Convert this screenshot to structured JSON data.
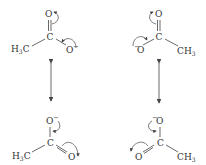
{
  "diagram": {
    "structures": [
      {
        "id": "top-left",
        "atoms": {
          "o_top": "O",
          "c_center": "C",
          "methyl": "H3C",
          "o_side": "O",
          "o_side_charge": "−"
        }
      },
      {
        "id": "top-right",
        "atoms": {
          "o_top": "O",
          "c_center": "C",
          "methyl": "CH3",
          "o_side": "O",
          "o_side_charge": "−"
        }
      },
      {
        "id": "bottom-left",
        "atoms": {
          "o_top": "O",
          "o_top_charge": "−",
          "c_center": "C",
          "methyl": "H3C",
          "o_side": "O"
        }
      },
      {
        "id": "bottom-right",
        "atoms": {
          "o_top": "O",
          "o_top_charge": "−",
          "c_center": "C",
          "methyl": "CH3",
          "o_side": "O"
        }
      }
    ],
    "resonance_arrows": [
      {
        "id": "left",
        "symbol": "double-headed-arrow"
      },
      {
        "id": "right",
        "symbol": "double-headed-arrow"
      }
    ],
    "colors": {
      "ink": "#333333",
      "background": "#ffffff"
    }
  }
}
